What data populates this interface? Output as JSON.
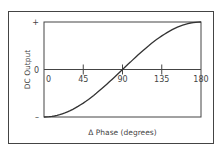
{
  "chart_data": {
    "type": "line",
    "title": "",
    "xlabel": "Δ Phase (degrees)",
    "ylabel": "DC Output",
    "x_ticks": [
      "0",
      "45",
      "90",
      "135",
      "180"
    ],
    "y_ticks": [
      "+",
      "0",
      "–"
    ],
    "xlim": [
      0,
      180
    ],
    "ylim": [
      -1,
      1
    ],
    "grid": false,
    "series": [
      {
        "name": "DC Output vs Phase",
        "x": [
          0,
          22.5,
          45,
          67.5,
          90,
          112.5,
          135,
          157.5,
          180
        ],
        "y": [
          -1,
          -0.92,
          -0.71,
          -0.38,
          0,
          0.38,
          0.71,
          0.92,
          1
        ]
      }
    ],
    "colors": {
      "line": "#333333",
      "axis": "#444444",
      "frame": "#444444"
    }
  }
}
